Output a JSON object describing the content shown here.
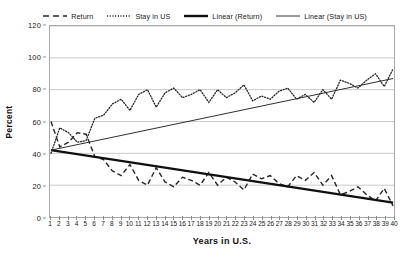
{
  "chart_data": {
    "type": "line",
    "title": "",
    "xlabel": "Years in U.S.",
    "ylabel": "Percent",
    "xlim": [
      1,
      40
    ],
    "ylim": [
      0,
      120
    ],
    "ytick_values": [
      0,
      20,
      40,
      60,
      80,
      100,
      120
    ],
    "xtick_values": [
      1,
      2,
      3,
      4,
      5,
      6,
      7,
      8,
      9,
      10,
      11,
      12,
      13,
      14,
      15,
      16,
      17,
      18,
      19,
      20,
      21,
      22,
      23,
      24,
      25,
      26,
      27,
      28,
      29,
      30,
      31,
      32,
      33,
      34,
      35,
      36,
      37,
      38,
      39,
      40
    ],
    "grid": true,
    "grid_axis": "y",
    "legend_position": "top-center",
    "legend": [
      {
        "label": "Return",
        "style": "dashed",
        "width": 1.3,
        "color": "#262626"
      },
      {
        "label": "Stay in US",
        "style": "dotted",
        "width": 1.3,
        "color": "#262626"
      },
      {
        "label": "Linear (Return)",
        "style": "solid",
        "width": 2.4,
        "color": "#101010"
      },
      {
        "label": "Linear (Stay in US)",
        "style": "solid",
        "width": 1.0,
        "color": "#303030"
      }
    ],
    "x": [
      1,
      2,
      3,
      4,
      5,
      6,
      7,
      8,
      9,
      10,
      11,
      12,
      13,
      14,
      15,
      16,
      17,
      18,
      19,
      20,
      21,
      22,
      23,
      24,
      25,
      26,
      27,
      28,
      29,
      30,
      31,
      32,
      33,
      34,
      35,
      36,
      37,
      38,
      39,
      40
    ],
    "series": [
      {
        "name": "Return",
        "style": "dashed",
        "values": [
          60,
          44,
          47,
          53,
          52,
          38,
          36,
          29,
          26,
          33,
          23,
          20,
          31,
          22,
          19,
          25,
          23,
          20,
          28,
          20,
          25,
          22,
          17,
          27,
          24,
          26,
          21,
          19,
          26,
          23,
          28,
          20,
          26,
          14,
          16,
          19,
          14,
          10,
          18,
          7
        ]
      },
      {
        "name": "Stay in US",
        "style": "dotted",
        "values": [
          40,
          56,
          53,
          47,
          48,
          62,
          64,
          71,
          74,
          67,
          77,
          80,
          69,
          78,
          81,
          75,
          77,
          80,
          72,
          80,
          75,
          78,
          83,
          73,
          76,
          74,
          79,
          81,
          74,
          77,
          72,
          80,
          74,
          86,
          84,
          81,
          86,
          90,
          82,
          93
        ]
      }
    ],
    "trendlines": [
      {
        "name": "Linear (Return)",
        "style": "solid",
        "width": 2.4,
        "x0": 1,
        "y0": 42,
        "x1": 40,
        "y1": 9
      },
      {
        "name": "Linear (Stay in US)",
        "style": "solid",
        "width": 1.0,
        "x0": 1,
        "y0": 42,
        "x1": 40,
        "y1": 87
      }
    ]
  },
  "axes": {
    "y_title": "Percent",
    "x_title": "Years in U.S.",
    "y_ticks": [
      "0",
      "20",
      "40",
      "60",
      "80",
      "100",
      "120"
    ],
    "x_ticks": [
      "1",
      "2",
      "3",
      "4",
      "5",
      "6",
      "7",
      "8",
      "9",
      "10",
      "11",
      "12",
      "13",
      "14",
      "15",
      "16",
      "17",
      "18",
      "19",
      "20",
      "21",
      "22",
      "23",
      "24",
      "25",
      "26",
      "27",
      "28",
      "29",
      "30",
      "31",
      "32",
      "33",
      "34",
      "35",
      "36",
      "37",
      "38",
      "39",
      "40"
    ]
  },
  "legend_items": [
    {
      "label": "Return"
    },
    {
      "label": "Stay in US"
    },
    {
      "label": "Linear (Return)"
    },
    {
      "label": "Linear (Stay in US)"
    }
  ],
  "colors": {
    "series": "#262626",
    "trend_return": "#101010",
    "trend_stay": "#303030",
    "grid": "#c9c9c9",
    "frame": "#a8a8a8",
    "text": "#161616"
  }
}
